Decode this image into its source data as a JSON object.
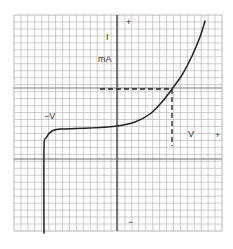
{
  "chart_data": {
    "type": "line",
    "title": "",
    "xlabel": "V",
    "ylabel": "I mA",
    "labels": {
      "current": "I",
      "current_unit": "mA",
      "negative_voltage": "−V",
      "positive_voltage": "V",
      "top_sign": "+",
      "right_sign": "+",
      "bottom_sign": "−"
    },
    "grid": true,
    "grid_cells": {
      "x": 30,
      "y": 31
    },
    "curve_pixels": [
      [
        44,
        233
      ],
      [
        44,
        150
      ],
      [
        46,
        138
      ],
      [
        52,
        131
      ],
      [
        62,
        129
      ],
      [
        90,
        128
      ],
      [
        117,
        126
      ],
      [
        135,
        122
      ],
      [
        150,
        114
      ],
      [
        162,
        102
      ],
      [
        172,
        89
      ],
      [
        182,
        75
      ],
      [
        192,
        56
      ],
      [
        200,
        37
      ],
      [
        205,
        21
      ]
    ],
    "operating_point_pixels": [
      172,
      89
    ],
    "dashed_guides": [
      {
        "from": [
          100,
          89
        ],
        "to": [
          172,
          89
        ]
      },
      {
        "from": [
          172,
          89
        ],
        "to": [
          172,
          146
        ]
      }
    ]
  },
  "colors": {
    "grid": "#b8b8b8",
    "axis": "#3a3a3a",
    "curve": "#222222",
    "text": "#333333"
  }
}
